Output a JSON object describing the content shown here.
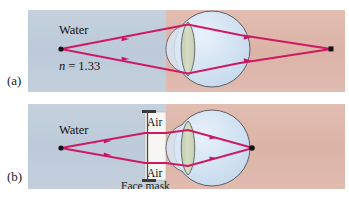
{
  "figure": {
    "panels": [
      {
        "id": "a",
        "letter": "(a)",
        "labels": {
          "medium": "Water",
          "index": "n = 1.33",
          "index_symbol": "n",
          "index_equals": "=",
          "index_value": "1.33"
        },
        "description": "Light from an object in water refracts weakly at the cornea and focuses behind the retina"
      },
      {
        "id": "b",
        "letter": "(b)",
        "labels": {
          "medium": "Water",
          "air_top": "Air",
          "air_bottom": "Air",
          "mask": "Face mask"
        },
        "description": "A face mask places air in front of the eye so the cornea focuses light on the retina"
      }
    ],
    "colors": {
      "water": "#bfccd9",
      "air_pink": "#dfb7ab",
      "ray": "#d31b60",
      "eye_fill": "#cfe1f1",
      "eye_outline": "#53565c",
      "lens_fill": "#cdd6bb",
      "lens_outline": "#53565c",
      "mask_fill": "#f8f7f4",
      "mask_cap": "#3a3a3a",
      "point": "#1a1a1a",
      "text": "#141414"
    },
    "geometry": {
      "panel_a": {
        "x": 28,
        "y": 10,
        "width": 317,
        "height": 82,
        "water_pink_boundary_x": 166,
        "source_point": {
          "x": 61,
          "y": 49
        },
        "focus_point": {
          "x": 331,
          "y": 49
        },
        "eye_center": {
          "x": 212,
          "y": 49
        },
        "eye_radius": 38
      },
      "panel_b": {
        "x": 28,
        "y": 104,
        "width": 317,
        "height": 85,
        "water_pink_boundary_x": 166,
        "source_point": {
          "x": 61,
          "y": 148
        },
        "focus_point": {
          "x": 253,
          "y": 148
        },
        "eye_center": {
          "x": 212,
          "y": 148
        },
        "eye_radius": 38,
        "mask_x": 145,
        "mask_top": 110,
        "mask_bottom": 182
      }
    }
  }
}
